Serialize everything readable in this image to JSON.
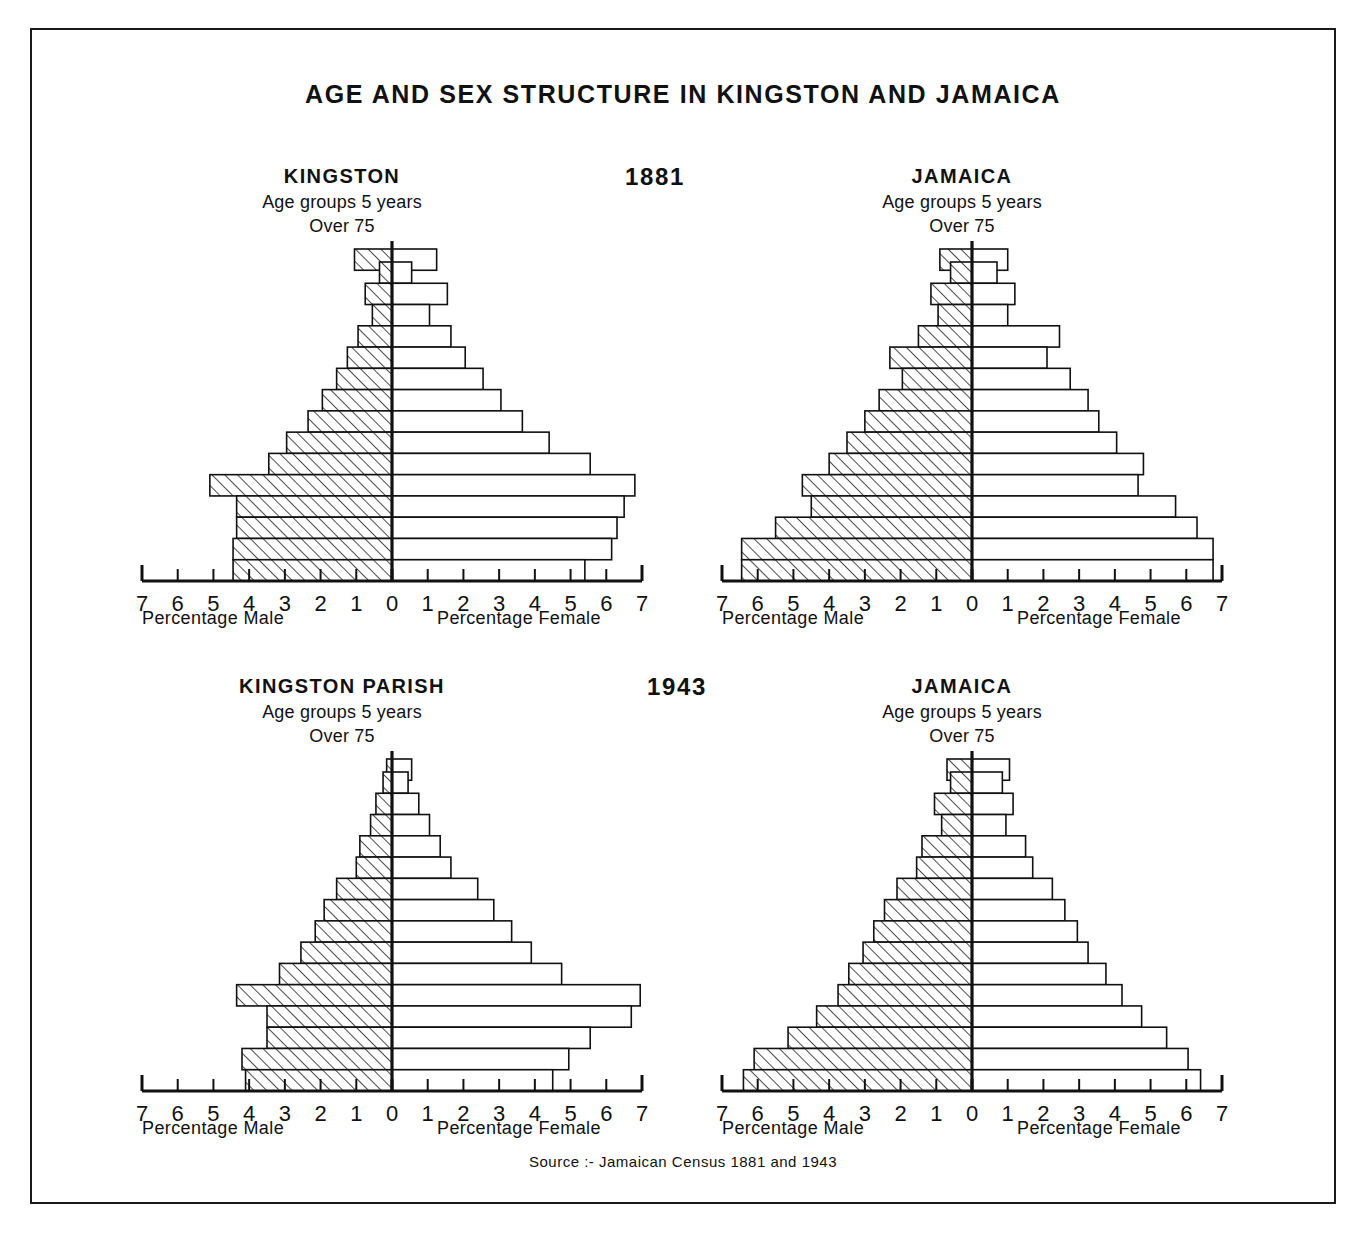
{
  "figure": {
    "title": "AGE AND SEX STRUCTURE IN KINGSTON AND JAMAICA",
    "source": "Source :- Jamaican Census 1881 and 1943",
    "subtitle_age_groups": "Age groups 5 years",
    "subtitle_over": "Over 75",
    "axis_label_male": "Percentage  Male",
    "axis_label_female": "Percentage  Female",
    "year_1881": "1881",
    "year_1943": "1943",
    "border_color": "#1a1a1a",
    "ink_color": "#111111"
  },
  "panels": [
    {
      "id": "kingston-1881",
      "heading": "KINGSTON",
      "year": "1881"
    },
    {
      "id": "jamaica-1881",
      "heading": "JAMAICA",
      "year": "1881"
    },
    {
      "id": "kingston-parish-1943",
      "heading": "KINGSTON PARISH",
      "year": "1943"
    },
    {
      "id": "jamaica-1943",
      "heading": "JAMAICA",
      "year": "1943"
    }
  ],
  "chart_data": [
    {
      "type": "bar",
      "subtype": "population-pyramid",
      "id": "kingston-1881",
      "title": "KINGSTON",
      "subtitle": "Age groups 5 years",
      "annotation": "Over 75",
      "year": "1881",
      "xlabel_left": "Percentage  Male",
      "xlabel_right": "Percentage  Female",
      "ylabel": "",
      "xlim": [
        -7,
        7
      ],
      "xticks": [
        7,
        6,
        5,
        4,
        3,
        2,
        1,
        0,
        1,
        2,
        3,
        4,
        5,
        6,
        7
      ],
      "grid": false,
      "legend": [
        "Percentage Male (hatched)",
        "Percentage Female (plain)"
      ],
      "categories": [
        "Over 75",
        "70-74",
        "65-69",
        "60-64",
        "55-59",
        "50-54",
        "45-49",
        "40-44",
        "35-39",
        "30-34",
        "25-29",
        "20-24",
        "15-19",
        "10-14",
        "5-9",
        "0-4"
      ],
      "series": [
        {
          "name": "Percentage Male",
          "values": [
            1.05,
            0.35,
            0.75,
            0.55,
            0.95,
            1.25,
            1.55,
            1.95,
            2.35,
            2.95,
            3.45,
            5.1,
            4.35,
            4.35,
            4.45,
            4.45
          ]
        },
        {
          "name": "Percentage Female",
          "values": [
            1.25,
            0.55,
            1.55,
            1.05,
            1.65,
            2.05,
            2.55,
            3.05,
            3.65,
            4.4,
            5.55,
            6.8,
            6.5,
            6.3,
            6.15,
            5.4
          ]
        }
      ]
    },
    {
      "type": "bar",
      "subtype": "population-pyramid",
      "id": "jamaica-1881",
      "title": "JAMAICA",
      "subtitle": "Age groups 5 years",
      "annotation": "Over 75",
      "year": "1881",
      "xlabel_left": "Percentage  Male",
      "xlabel_right": "Percentage  Female",
      "ylabel": "",
      "xlim": [
        -7,
        7
      ],
      "xticks": [
        7,
        6,
        5,
        4,
        3,
        2,
        1,
        0,
        1,
        2,
        3,
        4,
        5,
        6,
        7
      ],
      "grid": false,
      "legend": [
        "Percentage Male (hatched)",
        "Percentage Female (plain)"
      ],
      "categories": [
        "Over 75",
        "70-74",
        "65-69",
        "60-64",
        "55-59",
        "50-54",
        "45-49",
        "40-44",
        "35-39",
        "30-34",
        "25-29",
        "20-24",
        "15-19",
        "10-14",
        "5-9",
        "0-4"
      ],
      "series": [
        {
          "name": "Percentage Male",
          "values": [
            0.9,
            0.6,
            1.15,
            0.95,
            1.5,
            2.3,
            1.95,
            2.6,
            3.0,
            3.5,
            4.0,
            4.75,
            4.5,
            5.5,
            6.45,
            6.45
          ]
        },
        {
          "name": "Percentage Female",
          "values": [
            1.0,
            0.7,
            1.2,
            1.0,
            2.45,
            2.1,
            2.75,
            3.25,
            3.55,
            4.05,
            4.8,
            4.65,
            5.7,
            6.3,
            6.75,
            6.75
          ]
        }
      ]
    },
    {
      "type": "bar",
      "subtype": "population-pyramid",
      "id": "kingston-parish-1943",
      "title": "KINGSTON PARISH",
      "subtitle": "Age groups 5 years",
      "annotation": "Over 75",
      "year": "1943",
      "xlabel_left": "Percentage  Male",
      "xlabel_right": "Percentage  Female",
      "ylabel": "",
      "xlim": [
        -7,
        7
      ],
      "xticks": [
        7,
        6,
        5,
        4,
        3,
        2,
        1,
        0,
        1,
        2,
        3,
        4,
        5,
        6,
        7
      ],
      "grid": false,
      "legend": [
        "Percentage Male (hatched)",
        "Percentage Female (plain)"
      ],
      "categories": [
        "Over 75",
        "70-74",
        "65-69",
        "60-64",
        "55-59",
        "50-54",
        "45-49",
        "40-44",
        "35-39",
        "30-34",
        "25-29",
        "20-24",
        "15-19",
        "10-14",
        "5-9",
        "0-4"
      ],
      "series": [
        {
          "name": "Percentage Male",
          "values": [
            0.15,
            0.25,
            0.45,
            0.6,
            0.9,
            1.0,
            1.55,
            1.9,
            2.15,
            2.55,
            3.15,
            4.35,
            3.5,
            3.5,
            4.2,
            4.1
          ]
        },
        {
          "name": "Percentage Female",
          "values": [
            0.55,
            0.45,
            0.75,
            1.05,
            1.35,
            1.65,
            2.4,
            2.85,
            3.35,
            3.9,
            4.75,
            6.95,
            6.7,
            5.55,
            4.95,
            4.5
          ]
        }
      ]
    },
    {
      "type": "bar",
      "subtype": "population-pyramid",
      "id": "jamaica-1943",
      "title": "JAMAICA",
      "subtitle": "Age groups 5 years",
      "annotation": "Over 75",
      "year": "1943",
      "xlabel_left": "Percentage  Male",
      "xlabel_right": "Percentage  Female",
      "ylabel": "",
      "xlim": [
        -7,
        7
      ],
      "xticks": [
        7,
        6,
        5,
        4,
        3,
        2,
        1,
        0,
        1,
        2,
        3,
        4,
        5,
        6,
        7
      ],
      "grid": false,
      "legend": [
        "Percentage Male (hatched)",
        "Percentage Female (plain)"
      ],
      "categories": [
        "Over 75",
        "70-74",
        "65-69",
        "60-64",
        "55-59",
        "50-54",
        "45-49",
        "40-44",
        "35-39",
        "30-34",
        "25-29",
        "20-24",
        "15-19",
        "10-14",
        "5-9",
        "0-4"
      ],
      "series": [
        {
          "name": "Percentage Male",
          "values": [
            0.7,
            0.6,
            1.05,
            0.85,
            1.4,
            1.55,
            2.1,
            2.45,
            2.75,
            3.05,
            3.45,
            3.75,
            4.35,
            5.15,
            6.1,
            6.4
          ]
        },
        {
          "name": "Percentage Female",
          "values": [
            1.05,
            0.85,
            1.15,
            0.95,
            1.5,
            1.7,
            2.25,
            2.6,
            2.95,
            3.25,
            3.75,
            4.2,
            4.75,
            5.45,
            6.05,
            6.4
          ]
        }
      ]
    }
  ]
}
